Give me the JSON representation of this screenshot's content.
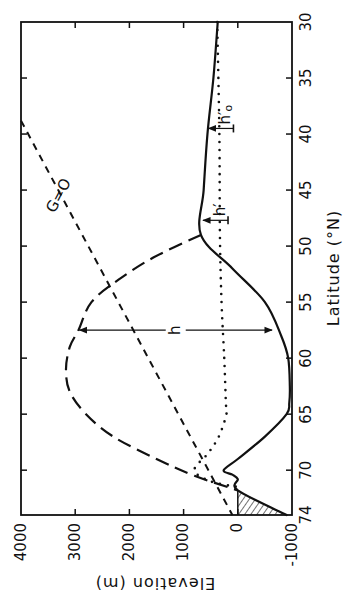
{
  "chart_data": {
    "type": "line",
    "orientation": "rotated 90° (latitude runs top→bottom along the right edge; elevation runs left→right, decreasing)",
    "title": "",
    "xlabel": "Latitude (°N)",
    "ylabel": "Elevation (m)",
    "xlim": [
      30,
      74
    ],
    "ylim": [
      -1000,
      4000
    ],
    "x_ticks": [
      30,
      35,
      40,
      45,
      50,
      55,
      60,
      65,
      70,
      74
    ],
    "y_ticks": [
      4000,
      3000,
      2000,
      1000,
      0,
      -1000
    ],
    "grid": false,
    "legend": null,
    "series": [
      {
        "name": "bed / land surface (solid)",
        "style": "solid",
        "x": [
          30,
          35,
          40,
          45,
          49,
          52,
          55,
          58,
          60,
          62.5,
          64,
          65,
          67,
          69,
          70,
          70.4,
          70.8,
          71.8,
          74
        ],
        "y": [
          370,
          450,
          560,
          630,
          680,
          100,
          -500,
          -800,
          -930,
          -960,
          -950,
          -900,
          -500,
          0,
          260,
          100,
          0,
          0,
          -900
        ]
      },
      {
        "name": "ice surface (long dash)",
        "style": "long-dash",
        "x": [
          49,
          51,
          53,
          55,
          57.5,
          59,
          61,
          63,
          65,
          67,
          69,
          70.5,
          71.8
        ],
        "y": [
          680,
          1550,
          2200,
          2700,
          2940,
          3100,
          3170,
          3100,
          2800,
          2300,
          1500,
          800,
          0
        ]
      },
      {
        "name": "dotted reference level",
        "style": "dotted",
        "x": [
          30,
          40,
          49,
          55,
          60,
          64,
          65,
          67,
          68.5,
          70,
          71,
          71.5
        ],
        "y": [
          380,
          340,
          330,
          300,
          250,
          220,
          210,
          350,
          550,
          800,
          500,
          0
        ]
      },
      {
        "name": "G=0",
        "style": "short-dash",
        "x": [
          38.8,
          74
        ],
        "y": [
          4000,
          100
        ]
      }
    ],
    "annotations": [
      {
        "text": "h",
        "type": "double-arrow",
        "lat": 57.5,
        "from_elev": 2940,
        "to_elev": -650
      },
      {
        "text": "h′",
        "type": "arrow-marker",
        "lat": 47.7,
        "elev": 660
      },
      {
        "text": "h′₀",
        "type": "arrow-marker",
        "lat": 39.5,
        "elev": 560
      },
      {
        "text": "G=0",
        "type": "line-label",
        "lat": 45.5,
        "elev": 3300
      }
    ],
    "hatched_region": {
      "lat_range": [
        71.8,
        74
      ],
      "elev_range": [
        -900,
        0
      ],
      "description": "submarine wedge below sea level"
    }
  },
  "labels": {
    "xlabel": "Latitude (°N)",
    "ylabel": "Elevation (m)",
    "h": "h",
    "h_prime": "h′",
    "h_prime_zero_main": "h′",
    "h_prime_zero_sub": "o",
    "g_zero": "G=O"
  }
}
